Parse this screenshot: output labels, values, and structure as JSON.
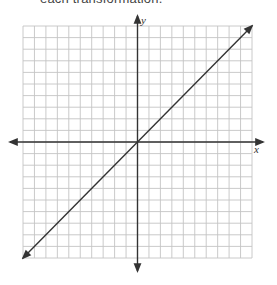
{
  "caption": "each transformation.",
  "chart_data": {
    "type": "line",
    "title": "",
    "xlabel": "x",
    "ylabel": "y",
    "xlim": [
      -10,
      10
    ],
    "ylim": [
      -10,
      10
    ],
    "grid": true,
    "grid_step": 1,
    "tick_labels": false,
    "series": [
      {
        "name": "y = x",
        "x": [
          -10,
          10
        ],
        "y": [
          -10,
          10
        ],
        "arrows": "both",
        "color": "#333333"
      }
    ]
  },
  "colors": {
    "grid": "#c4c4c4",
    "axis": "#333333",
    "line": "#333333"
  }
}
